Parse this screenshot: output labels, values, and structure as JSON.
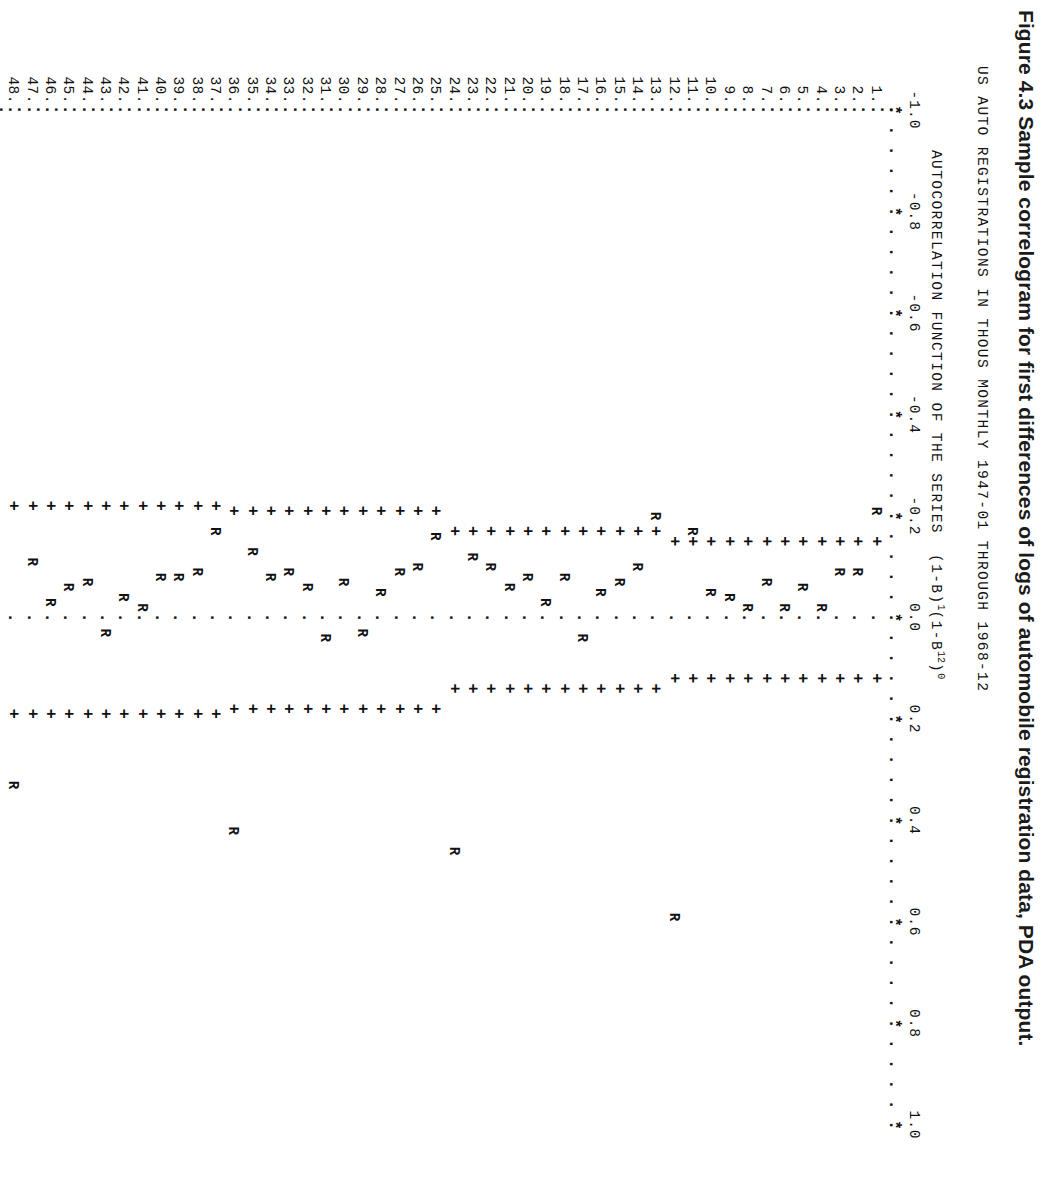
{
  "figure": {
    "caption": "Figure 4.3  Sample correlogram for first differences of logs of automobile registration data, PDA output.",
    "header_line_1": "US AUTO REGISTRATIONS IN THOUS MONTHLY 1947-01 THROUGH 1968-12",
    "header_line_2_prefix": "AUTOCORRELATION FUNCTION OF THE SERIES  (1-B)",
    "header_line_2_exp1": "1",
    "header_line_2_mid": "(1-B",
    "header_line_2_exp2": "12",
    "header_line_2_exp3": "0",
    "header_line_2_suffix": ")"
  },
  "symbols": {
    "axis_tick": "*",
    "axis_line": ".",
    "zero_line": ".",
    "confidence_band": "+",
    "autocorrelation": "R"
  },
  "chart_data": {
    "type": "line",
    "title": "AUTOCORRELATION FUNCTION OF THE SERIES (1-B)1(1-B12)0",
    "subtitle": "US AUTO REGISTRATIONS IN THOUS MONTHLY 1947-01 THROUGH 1968-12",
    "xlabel": "AUTOCORRELATION",
    "ylabel": "LAG",
    "orientation": "horizontal-lag-axis-vertical",
    "xlim": [
      -1.0,
      1.0
    ],
    "grid": false,
    "legend": "none",
    "tick_labels": [
      "-1.0",
      "-0.8",
      "-0.6",
      "-0.4",
      "-0.2",
      "0.0",
      "0.2",
      "0.4",
      "0.6",
      "0.8",
      "1.0"
    ],
    "tick_values": [
      -1.0,
      -0.8,
      -0.6,
      -0.4,
      -0.2,
      0.0,
      0.2,
      0.4,
      0.6,
      0.8,
      1.0
    ],
    "lags": [
      1,
      2,
      3,
      4,
      5,
      6,
      7,
      8,
      9,
      10,
      11,
      12,
      13,
      14,
      15,
      16,
      17,
      18,
      19,
      20,
      21,
      22,
      23,
      24,
      25,
      26,
      27,
      28,
      29,
      30,
      31,
      32,
      33,
      34,
      35,
      36,
      37,
      38,
      39,
      40,
      41,
      42,
      43,
      44,
      45,
      46,
      47,
      48
    ],
    "lag_labels": [
      "1.",
      "2.",
      "3.",
      "4.",
      "5.",
      "6.",
      "7.",
      "8.",
      "9.",
      "10.",
      "11.",
      "12.",
      "13.",
      "14.",
      "15.",
      "16.",
      "17.",
      "18.",
      "19.",
      "20.",
      "21.",
      "22.",
      "23.",
      "24.",
      "25.",
      "26.",
      "27.",
      "28.",
      "29.",
      "30.",
      "31.",
      "32.",
      "33.",
      "34.",
      "35.",
      "36.",
      "37.",
      "38.",
      "39.",
      "40.",
      "41.",
      "42.",
      "43.",
      "44.",
      "45.",
      "46.",
      "47.",
      "48."
    ],
    "acf": [
      -0.21,
      -0.09,
      -0.09,
      -0.02,
      -0.06,
      -0.02,
      -0.07,
      -0.02,
      -0.04,
      -0.05,
      -0.17,
      0.59,
      -0.2,
      -0.1,
      -0.07,
      -0.05,
      0.04,
      -0.08,
      -0.03,
      -0.08,
      -0.06,
      -0.1,
      -0.12,
      0.46,
      -0.16,
      -0.1,
      -0.09,
      -0.05,
      0.03,
      -0.07,
      0.04,
      -0.06,
      -0.09,
      -0.08,
      -0.13,
      0.42,
      -0.17,
      -0.09,
      -0.08,
      -0.08,
      -0.02,
      -0.04,
      0.03,
      -0.07,
      -0.06,
      -0.03,
      -0.11,
      0.33
    ],
    "confidence_bands": {
      "description": "two-standard-error limits, widening with lag",
      "upper": [
        0.12,
        0.12,
        0.12,
        0.12,
        0.12,
        0.12,
        0.12,
        0.12,
        0.12,
        0.12,
        0.12,
        0.12,
        0.14,
        0.14,
        0.14,
        0.14,
        0.14,
        0.14,
        0.14,
        0.14,
        0.14,
        0.14,
        0.14,
        0.14,
        0.18,
        0.18,
        0.18,
        0.18,
        0.18,
        0.18,
        0.18,
        0.18,
        0.18,
        0.18,
        0.18,
        0.18,
        0.19,
        0.19,
        0.19,
        0.19,
        0.19,
        0.19,
        0.19,
        0.19,
        0.19,
        0.19,
        0.19,
        0.19
      ],
      "lower": [
        -0.15,
        -0.15,
        -0.15,
        -0.15,
        -0.15,
        -0.15,
        -0.15,
        -0.15,
        -0.15,
        -0.15,
        -0.15,
        -0.15,
        -0.17,
        -0.17,
        -0.17,
        -0.17,
        -0.17,
        -0.17,
        -0.17,
        -0.17,
        -0.17,
        -0.17,
        -0.17,
        -0.17,
        -0.21,
        -0.21,
        -0.21,
        -0.21,
        -0.21,
        -0.21,
        -0.21,
        -0.21,
        -0.21,
        -0.21,
        -0.21,
        -0.21,
        -0.22,
        -0.22,
        -0.22,
        -0.22,
        -0.22,
        -0.22,
        -0.22,
        -0.22,
        -0.22,
        -0.22,
        -0.22,
        -0.22
      ]
    }
  }
}
